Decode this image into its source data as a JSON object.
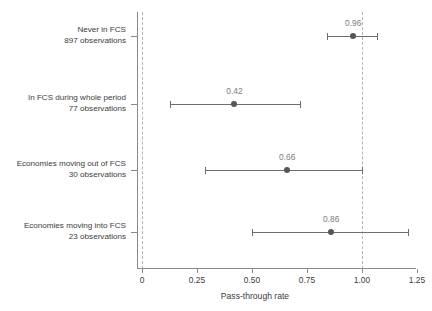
{
  "chart_data": {
    "type": "scatter",
    "subtype": "dot-and-whisker",
    "title": "",
    "xlabel": "Pass-through rate",
    "ylabel": "",
    "xlim": [
      -0.05,
      1.3
    ],
    "xticks": [
      0,
      0.25,
      0.5,
      0.75,
      1.0,
      1.25
    ],
    "xtick_labels": [
      "0",
      "0.25",
      "0.50",
      "0.75",
      "1.00",
      "1.25"
    ],
    "grid": false,
    "legend": "none",
    "reference_lines": [
      0,
      1.0
    ],
    "orientation": "horizontal",
    "categories": [
      "Never in FCS",
      "In FCS during whole period",
      "Economies moving out of FCS",
      "Economies moving into FCS"
    ],
    "observations": [
      "897 observations",
      "77 observations",
      "30 observations",
      "23 observations"
    ],
    "values": [
      0.96,
      0.42,
      0.66,
      0.86
    ],
    "value_labels": [
      "0.96",
      "0.42",
      "0.66",
      "0.86"
    ],
    "ci_low": [
      0.84,
      0.125,
      0.285,
      0.5
    ],
    "ci_high": [
      1.07,
      0.72,
      1.0,
      1.21
    ],
    "colors": {
      "dot": "#555555",
      "errorbar": "#6e6e6e",
      "axis": "#8a8a8a",
      "reference_line": "#b4b4b4",
      "value_label": "#7d7d7d",
      "text": "#3b3b3b",
      "background": "#ffffff"
    }
  }
}
